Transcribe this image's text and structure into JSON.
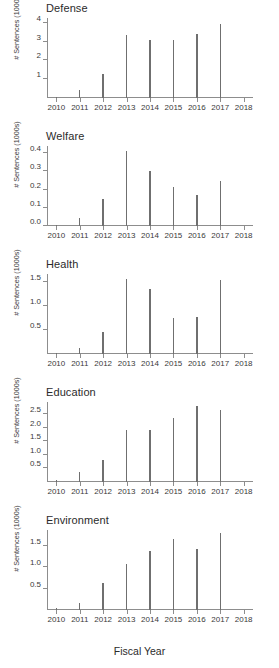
{
  "figure": {
    "xlabel": "Fiscal Year",
    "ylabel": "# Sentences (1000s)"
  },
  "chart_data": [
    {
      "type": "bar",
      "title": "Defense",
      "xlabel": "Fiscal Year",
      "ylabel": "# Sentences (1000s)",
      "categories": [
        "2010",
        "2011",
        "2012",
        "2013",
        "2014",
        "2015",
        "2016",
        "2017"
      ],
      "values": [
        0.05,
        0.42,
        1.28,
        3.33,
        3.07,
        3.06,
        3.38,
        3.95
      ],
      "xlim": [
        2009.6,
        2018.4
      ],
      "ylim": [
        0,
        4.25
      ],
      "yticks": [
        1,
        2,
        3,
        4
      ],
      "ytick_labels": [
        "1",
        "2",
        "3",
        "4"
      ],
      "xticks": [
        2010,
        2011,
        2012,
        2013,
        2014,
        2015,
        2016,
        2017,
        2018
      ],
      "xtick_labels": [
        "2010",
        "2011",
        "2012",
        "2013",
        "2014",
        "2015",
        "2016",
        "2017",
        "2018"
      ],
      "grid": false,
      "legend": false
    },
    {
      "type": "bar",
      "title": "Welfare",
      "xlabel": "Fiscal Year",
      "ylabel": "# Sentences (1000s)",
      "categories": [
        "2010",
        "2011",
        "2012",
        "2013",
        "2014",
        "2015",
        "2016",
        "2017"
      ],
      "values": [
        0.005,
        0.045,
        0.15,
        0.415,
        0.3,
        0.215,
        0.172,
        0.25
      ],
      "xlim": [
        2009.6,
        2018.4
      ],
      "ylim": [
        0,
        0.44
      ],
      "yticks": [
        0.0,
        0.1,
        0.2,
        0.3,
        0.4
      ],
      "ytick_labels": [
        "0.0",
        "0.1",
        "0.2",
        "0.3",
        "0.4"
      ],
      "xticks": [
        2010,
        2011,
        2012,
        2013,
        2014,
        2015,
        2016,
        2017,
        2018
      ],
      "xtick_labels": [
        "2010",
        "2011",
        "2012",
        "2013",
        "2014",
        "2015",
        "2016",
        "2017",
        "2018"
      ],
      "grid": false,
      "legend": false
    },
    {
      "type": "bar",
      "title": "Health",
      "xlabel": "Fiscal Year",
      "ylabel": "# Sentences (1000s)",
      "categories": [
        "2010",
        "2011",
        "2012",
        "2013",
        "2014",
        "2015",
        "2016",
        "2017"
      ],
      "values": [
        0.03,
        0.13,
        0.46,
        1.56,
        1.34,
        0.74,
        0.77,
        1.54
      ],
      "xlim": [
        2009.6,
        2018.4
      ],
      "ylim": [
        0,
        1.66
      ],
      "yticks": [
        0.5,
        1.0,
        1.5
      ],
      "ytick_labels": [
        "0.5",
        "1.0",
        "1.5"
      ],
      "xticks": [
        2010,
        2011,
        2012,
        2013,
        2014,
        2015,
        2016,
        2017,
        2018
      ],
      "xtick_labels": [
        "2010",
        "2011",
        "2012",
        "2013",
        "2014",
        "2015",
        "2016",
        "2017",
        "2018"
      ],
      "grid": false,
      "legend": false
    },
    {
      "type": "bar",
      "title": "Education",
      "xlabel": "Fiscal Year",
      "ylabel": "# Sentences (1000s)",
      "categories": [
        "2010",
        "2011",
        "2012",
        "2013",
        "2014",
        "2015",
        "2016",
        "2017"
      ],
      "values": [
        0.06,
        0.38,
        0.82,
        1.93,
        1.9,
        2.37,
        2.82,
        2.67
      ],
      "xlim": [
        2009.6,
        2018.4
      ],
      "ylim": [
        0,
        2.95
      ],
      "yticks": [
        0.5,
        1.0,
        1.5,
        2.0,
        2.5
      ],
      "ytick_labels": [
        "0.5",
        "1.0",
        "1.5",
        "2.0",
        "2.5"
      ],
      "xticks": [
        2010,
        2011,
        2012,
        2013,
        2014,
        2015,
        2016,
        2017,
        2018
      ],
      "xtick_labels": [
        "2010",
        "2011",
        "2012",
        "2013",
        "2014",
        "2015",
        "2016",
        "2017",
        "2018"
      ],
      "grid": false,
      "legend": false
    },
    {
      "type": "bar",
      "title": "Environment",
      "xlabel": "Fiscal Year",
      "ylabel": "# Sentences (1000s)",
      "categories": [
        "2010",
        "2011",
        "2012",
        "2013",
        "2014",
        "2015",
        "2016",
        "2017"
      ],
      "values": [
        0.04,
        0.17,
        0.63,
        1.07,
        1.38,
        1.66,
        1.43,
        1.8
      ],
      "xlim": [
        2009.6,
        2018.4
      ],
      "ylim": [
        0,
        1.88
      ],
      "yticks": [
        0.5,
        1.0,
        1.5
      ],
      "ytick_labels": [
        "0.5",
        "1.0",
        "1.5"
      ],
      "xticks": [
        2010,
        2011,
        2012,
        2013,
        2014,
        2015,
        2016,
        2017,
        2018
      ],
      "xtick_labels": [
        "2010",
        "2011",
        "2012",
        "2013",
        "2014",
        "2015",
        "2016",
        "2017",
        "2018"
      ],
      "grid": false,
      "legend": false
    }
  ]
}
